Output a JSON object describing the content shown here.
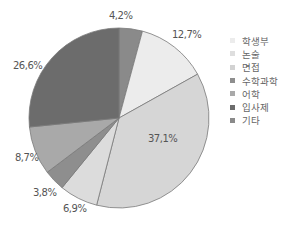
{
  "chart_data": {
    "type": "pie",
    "title": "",
    "start_angle_deg": 0,
    "direction": "clockwise",
    "slices": [
      {
        "label": "기타",
        "value": 4.2,
        "display": "4,2%",
        "color": "#8a8a8a"
      },
      {
        "label": "학생부",
        "value": 12.7,
        "display": "12,7%",
        "color": "#ececec"
      },
      {
        "label": "논술",
        "value": 37.1,
        "display": "37,1%",
        "color": "#d6d6d6"
      },
      {
        "label": "면접",
        "value": 6.9,
        "display": "6,9%",
        "color": "#dcdcdc"
      },
      {
        "label": "수학과학",
        "value": 3.8,
        "display": "3,8%",
        "color": "#8e8e8e"
      },
      {
        "label": "어학",
        "value": 8.7,
        "display": "8,7%",
        "color": "#a9a9a9"
      },
      {
        "label": "입사제",
        "value": 26.6,
        "display": "26,6%",
        "color": "#6c6c6c"
      }
    ],
    "legend": {
      "position": "right",
      "entries": [
        "학생부",
        "논술",
        "면접",
        "수학과학",
        "어학",
        "입사제",
        "기타"
      ]
    }
  },
  "legend_items": [
    {
      "label": "학생부",
      "color": "#ececec"
    },
    {
      "label": "논술",
      "color": "#dedede"
    },
    {
      "label": "면접",
      "color": "#d2d2d2"
    },
    {
      "label": "수학과학",
      "color": "#8e8e8e"
    },
    {
      "label": "어학",
      "color": "#a9a9a9"
    },
    {
      "label": "입사제",
      "color": "#6c6c6c"
    },
    {
      "label": "기타",
      "color": "#8a8a8a"
    }
  ],
  "labels": {
    "l_42": "4,2%",
    "l_127": "12,7%",
    "l_371": "37,1%",
    "l_69": "6,9%",
    "l_38": "3,8%",
    "l_87": "8,7%",
    "l_266": "26,6%"
  }
}
